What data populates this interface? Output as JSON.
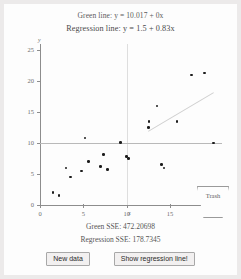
{
  "equations": {
    "green": "Green line: y = 10.017 + 0x",
    "regression": "Regression line: y = 1.5 + 0.83x"
  },
  "readouts": {
    "green_sse": "Green SSE: 472.20698",
    "regression_sse": "Regression SSE: 178.7345"
  },
  "buttons": {
    "new_data": "New data",
    "show_regression": "Show regression line!"
  },
  "trash": {
    "label": "Trash"
  },
  "colors": {
    "background": "#eceaea",
    "panel": "#fdfdfd",
    "axis": "#8d8d8d",
    "point": "#1c1c1c",
    "green_line": "#b9b9b9",
    "regression_line": "#cfcfcf",
    "gridline": "#dedede"
  },
  "chart_data": {
    "type": "scatter",
    "title": "",
    "xlabel": "x",
    "ylabel": "y",
    "xlim": [
      0,
      21
    ],
    "ylim": [
      0,
      26
    ],
    "xticks": [
      0,
      5,
      10,
      15,
      20
    ],
    "yticks": [
      0,
      5,
      10,
      15,
      20,
      25
    ],
    "grid": false,
    "gridlines": [
      {
        "orientation": "vertical",
        "value": 10,
        "color": "#dedede"
      }
    ],
    "points": [
      {
        "x": 1.5,
        "y": 2.0
      },
      {
        "x": 2.2,
        "y": 1.5
      },
      {
        "x": 3.0,
        "y": 6.0
      },
      {
        "x": 3.5,
        "y": 4.5
      },
      {
        "x": 4.8,
        "y": 5.5
      },
      {
        "x": 5.2,
        "y": 10.8
      },
      {
        "x": 5.6,
        "y": 7.0
      },
      {
        "x": 7.0,
        "y": 6.2
      },
      {
        "x": 7.3,
        "y": 8.2
      },
      {
        "x": 7.8,
        "y": 5.7
      },
      {
        "x": 9.3,
        "y": 10.1
      },
      {
        "x": 10.0,
        "y": 7.8
      },
      {
        "x": 10.2,
        "y": 7.5
      },
      {
        "x": 12.5,
        "y": 12.5
      },
      {
        "x": 12.6,
        "y": 13.5
      },
      {
        "x": 13.5,
        "y": 16.0
      },
      {
        "x": 14.0,
        "y": 6.5
      },
      {
        "x": 14.3,
        "y": 6.0
      },
      {
        "x": 15.8,
        "y": 13.5
      },
      {
        "x": 17.5,
        "y": 21.0
      },
      {
        "x": 19.0,
        "y": 21.3
      },
      {
        "x": 20.0,
        "y": 10.0
      }
    ],
    "lines": [
      {
        "name": "Green line",
        "intercept": 10.017,
        "slope": 0,
        "color": "#b9b9b9",
        "sse": 472.20698
      },
      {
        "name": "Regression line",
        "intercept": 1.5,
        "slope": 0.83,
        "color": "#cfcfcf",
        "sse": 178.7345,
        "visible_segment": [
          12.5,
          20
        ]
      }
    ]
  }
}
